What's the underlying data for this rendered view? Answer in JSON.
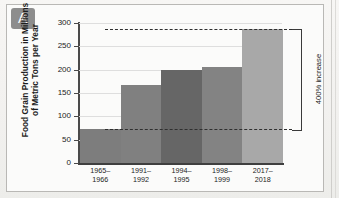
{
  "figure": {
    "panel_label": "A",
    "y_axis_title_line1": "Food Grain Production in Millions",
    "y_axis_title_line2": "of Metric Tons per Year"
  },
  "chart_data": {
    "type": "bar",
    "title": "",
    "xlabel": "",
    "ylabel": "Food Grain Production in Millions of Metric Tons per Year",
    "categories": [
      "1965–\n1966",
      "1991–\n1992",
      "1994–\n1995",
      "1998–\n1999",
      "2017–\n2018"
    ],
    "category_lines": [
      [
        "1965–",
        "1966"
      ],
      [
        "1991–",
        "1992"
      ],
      [
        "1994–",
        "1995"
      ],
      [
        "1998–",
        "1999"
      ],
      [
        "2017–",
        "2018"
      ]
    ],
    "values": [
      72,
      167,
      200,
      205,
      287
    ],
    "bar_colors": [
      "#7d7d7d",
      "#808080",
      "#666666",
      "#838383",
      "#a8a8a8"
    ],
    "ylim": [
      0,
      300
    ],
    "yticks": [
      0,
      50,
      100,
      150,
      200,
      250,
      300
    ],
    "ytick_labels": [
      "0",
      "50",
      "100",
      "150",
      "200",
      "250",
      "300"
    ],
    "grid": true,
    "legend": "none",
    "annotations": [
      {
        "text": "400% increase",
        "type": "bracket",
        "from_value": 72,
        "to_value": 287,
        "rotated": true
      }
    ]
  },
  "colors": {
    "panel_label_bg": "#8d8d8d",
    "axis": "#4a4a4a",
    "gridline": "#dedede",
    "annotation": "#2f2f2f",
    "background": "#fbfbfa"
  }
}
